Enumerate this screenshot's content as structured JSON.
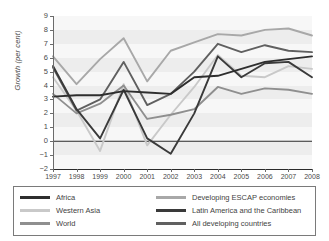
{
  "chart_data": {
    "type": "line",
    "title": "",
    "xlabel": "",
    "ylabel": "Growth (per cent)",
    "categories": [
      "1997",
      "1998",
      "1999",
      "2000",
      "2001",
      "2002",
      "2003",
      "2004",
      "2005",
      "2006",
      "2007",
      "2008"
    ],
    "ylim": [
      -2,
      9
    ],
    "yticks": [
      "9",
      "8",
      "7",
      "6",
      "5",
      "4",
      "3",
      "2",
      "1",
      "0",
      "−1",
      "−2"
    ],
    "grid": true,
    "legend_position": "bottom",
    "series": [
      {
        "name": "Africa",
        "color": "#2e2e2e",
        "values": [
          3.2,
          3.3,
          3.3,
          3.6,
          3.5,
          3.4,
          4.6,
          4.7,
          5.2,
          5.7,
          5.9,
          6.1
        ]
      },
      {
        "name": "Western Asia",
        "color": "#c9c9c9",
        "values": [
          4.6,
          2.2,
          -0.7,
          4.1,
          -0.3,
          1.9,
          3.9,
          6.2,
          4.7,
          4.6,
          5.4,
          5.2
        ]
      },
      {
        "name": "World",
        "color": "#8f8f8f",
        "values": [
          3.4,
          2.0,
          2.7,
          4.0,
          1.6,
          1.9,
          2.3,
          3.9,
          3.4,
          3.8,
          3.7,
          3.4
        ]
      },
      {
        "name": "Developing ESCAP economies",
        "color": "#a8a8a8",
        "values": [
          6.1,
          4.1,
          5.9,
          7.4,
          4.3,
          6.5,
          7.1,
          7.7,
          7.6,
          8.0,
          8.1,
          7.6
        ]
      },
      {
        "name": "Latin America and the Caribbean",
        "color": "#3a3a3a",
        "values": [
          5.4,
          2.3,
          0.2,
          3.7,
          0.2,
          -0.9,
          2.0,
          6.1,
          4.6,
          5.6,
          5.7,
          4.6
        ]
      },
      {
        "name": "All developing countries",
        "color": "#606060",
        "values": [
          5.3,
          2.2,
          3.0,
          5.7,
          2.6,
          3.4,
          5.0,
          7.0,
          6.4,
          6.9,
          6.5,
          6.4
        ]
      }
    ]
  },
  "legend": {
    "left": [
      {
        "label": "Africa",
        "color": "#2e2e2e"
      },
      {
        "label": "Western Asia",
        "color": "#c9c9c9"
      },
      {
        "label": "World",
        "color": "#8f8f8f"
      }
    ],
    "right": [
      {
        "label": "Developing ESCAP economies",
        "color": "#a8a8a8"
      },
      {
        "label": "Latin America and the Caribbean",
        "color": "#3a3a3a"
      },
      {
        "label": "All developing countries",
        "color": "#606060"
      }
    ]
  }
}
